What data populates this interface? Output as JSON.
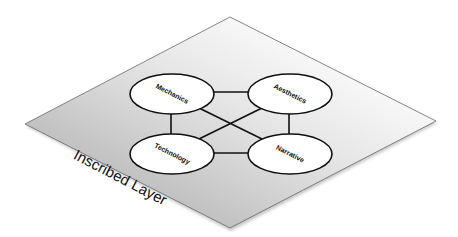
{
  "diagram": {
    "type": "isometric-layer-network",
    "layer": {
      "label": "Inscribed Layer",
      "vertices": {
        "top": [
          230,
          17
        ],
        "right": [
          436,
          121
        ],
        "bottom": [
          230,
          228
        ],
        "left": [
          25,
          124
        ]
      },
      "gradient_start": "#b3b3b3",
      "gradient_end": "#ffffff",
      "border_color": "#666666"
    },
    "nodes": [
      {
        "id": "mechanics",
        "label": "Mechanics",
        "cx": 172,
        "cy": 94
      },
      {
        "id": "aesthetics",
        "label": "Aesthetics",
        "cx": 290,
        "cy": 94
      },
      {
        "id": "technology",
        "label": "Technology",
        "cx": 172,
        "cy": 154
      },
      {
        "id": "narrative",
        "label": "Narrative",
        "cx": 290,
        "cy": 154
      }
    ],
    "edges": [
      {
        "from": "mechanics",
        "to": "aesthetics"
      },
      {
        "from": "mechanics",
        "to": "technology"
      },
      {
        "from": "mechanics",
        "to": "narrative"
      },
      {
        "from": "aesthetics",
        "to": "narrative"
      },
      {
        "from": "aesthetics",
        "to": "technology"
      },
      {
        "from": "technology",
        "to": "narrative"
      }
    ],
    "node_fill": "#ffffff",
    "node_stroke": "#111111",
    "edge_color": "#111111"
  }
}
